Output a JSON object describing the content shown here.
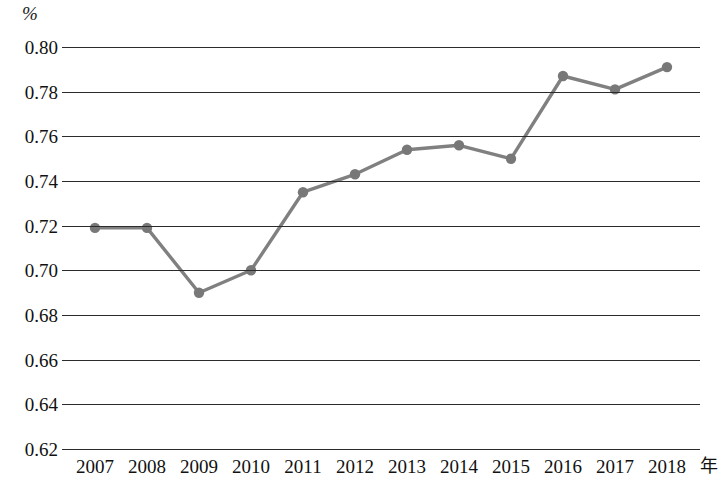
{
  "chart_data": {
    "type": "line",
    "title": "",
    "subtitle": "",
    "xlabel": "年",
    "ylabel": "%",
    "unit_label": "%",
    "categories": [
      "2007",
      "2008",
      "2009",
      "2010",
      "2011",
      "2012",
      "2013",
      "2014",
      "2015",
      "2016",
      "2017",
      "2018"
    ],
    "values": [
      0.719,
      0.719,
      0.69,
      0.7,
      0.735,
      0.743,
      0.754,
      0.756,
      0.75,
      0.787,
      0.781,
      0.791
    ],
    "series": [
      {
        "name": "",
        "values": [
          0.719,
          0.719,
          0.69,
          0.7,
          0.735,
          0.743,
          0.754,
          0.756,
          0.75,
          0.787,
          0.781,
          0.791
        ]
      }
    ],
    "ylim": [
      0.62,
      0.8
    ],
    "ytick_labels": [
      "0.80",
      "0.78",
      "0.76",
      "0.74",
      "0.72",
      "0.70",
      "0.68",
      "0.66",
      "0.64",
      "0.62"
    ],
    "ytick_values": [
      0.8,
      0.78,
      0.76,
      0.74,
      0.72,
      0.7,
      0.68,
      0.66,
      0.64,
      0.62
    ],
    "xtick_labels": [
      "2007",
      "2008",
      "2009",
      "2010",
      "2011",
      "2012",
      "2013",
      "2014",
      "2015",
      "2016",
      "2017",
      "2018"
    ],
    "grid": true,
    "grid_axis": "y",
    "legend": false,
    "legend_position": "none",
    "marker": "circle",
    "colors": {
      "line": "#808080",
      "marker": "#787878",
      "grid": "#2b2b2b",
      "text": "#111111",
      "background": "#ffffff"
    }
  }
}
